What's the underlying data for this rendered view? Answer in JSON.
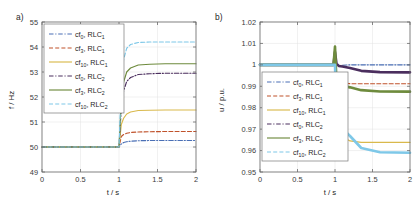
{
  "figure": {
    "panel_a_label": "a)",
    "panel_b_label": "b)"
  },
  "colors": {
    "c0_rlc1": "#4A6FB5",
    "c3_rlc1": "#C0522B",
    "c10_rlc1": "#D9B94C",
    "c0_rlc2": "#4B2E5E",
    "c3_rlc2": "#6E8B3D",
    "c10_rlc2": "#7EC8E8",
    "axis": "#6b6b6b",
    "grid": "#e2e2e2",
    "text": "#262626"
  },
  "legend": {
    "entries": [
      {
        "prefix": "cf",
        "sub": "0",
        "suffix": ", RLC",
        "sub2": "1",
        "label": "cf0, RLC1",
        "color_key": "c0_rlc1",
        "dash": "dashdot"
      },
      {
        "prefix": "cf",
        "sub": "3",
        "suffix": ", RLC",
        "sub2": "1",
        "label": "cf3, RLC1",
        "color_key": "c3_rlc1",
        "dash": "dashed"
      },
      {
        "prefix": "cf",
        "sub": "10",
        "suffix": ", RLC",
        "sub2": "1",
        "label": "cf10, RLC1",
        "color_key": "c10_rlc1",
        "dash": "solid"
      },
      {
        "prefix": "cf",
        "sub": "0",
        "suffix": ", RLC",
        "sub2": "2",
        "label": "cf0, RLC2",
        "color_key": "c0_rlc2",
        "dash": "dashdot"
      },
      {
        "prefix": "cf",
        "sub": "3",
        "suffix": ", RLC",
        "sub2": "2",
        "label": "cf3, RLC2",
        "color_key": "c3_rlc2",
        "dash": "solid"
      },
      {
        "prefix": "cf",
        "sub": "10",
        "suffix": ", RLC",
        "sub2": "2",
        "label": "cf10, RLC2",
        "color_key": "c10_rlc2",
        "dash": "dashed"
      }
    ]
  },
  "chart_data": [
    {
      "id": "panel_a",
      "type": "line",
      "title": "a)",
      "xlabel": "t / s",
      "ylabel": "f / Hz",
      "xlim": [
        0,
        2
      ],
      "ylim": [
        49,
        55
      ],
      "xticks": [
        0,
        0.5,
        1,
        1.5,
        2
      ],
      "xticklabels": [
        "0",
        "0.5",
        "1",
        "1.5",
        "2"
      ],
      "yticks": [
        49,
        50,
        51,
        52,
        53,
        54,
        55
      ],
      "yticklabels": [
        "49",
        "50",
        "51",
        "52",
        "53",
        "54",
        "55"
      ],
      "grid": true,
      "legend_position": "upper-left",
      "event_time": 1.0,
      "series": [
        {
          "name": "cf0, RLC1",
          "color_key": "c0_rlc1",
          "dash": "dashdot",
          "initial": 50.0,
          "final": 50.25,
          "x": [
            0,
            0.5,
            0.95,
            1.0,
            1.03,
            1.06,
            1.1,
            1.15,
            1.25,
            1.4,
            1.6,
            2.0
          ],
          "y": [
            50.0,
            50.0,
            50.0,
            50.0,
            50.12,
            50.18,
            50.21,
            50.23,
            50.25,
            50.26,
            50.26,
            50.26
          ]
        },
        {
          "name": "cf3, RLC1",
          "color_key": "c3_rlc1",
          "dash": "dashed",
          "initial": 50.0,
          "final": 50.62,
          "x": [
            0,
            0.5,
            0.95,
            1.0,
            1.03,
            1.06,
            1.1,
            1.15,
            1.25,
            1.4,
            1.6,
            2.0
          ],
          "y": [
            50.0,
            50.0,
            50.0,
            50.0,
            50.42,
            50.5,
            50.55,
            50.58,
            50.6,
            50.61,
            50.62,
            50.62
          ]
        },
        {
          "name": "cf10, RLC1",
          "color_key": "c10_rlc1",
          "dash": "solid",
          "initial": 50.0,
          "final": 51.48,
          "x": [
            0,
            0.5,
            0.95,
            1.0,
            1.03,
            1.06,
            1.1,
            1.15,
            1.25,
            1.4,
            1.6,
            2.0
          ],
          "y": [
            50.0,
            50.0,
            50.0,
            50.0,
            50.9,
            51.15,
            51.32,
            51.4,
            51.46,
            51.47,
            51.48,
            51.48
          ]
        },
        {
          "name": "cf0, RLC2",
          "color_key": "c0_rlc2",
          "dash": "dashdot",
          "initial": 50.0,
          "final": 52.95,
          "x": [
            0,
            0.5,
            0.95,
            1.0,
            1.03,
            1.06,
            1.1,
            1.15,
            1.25,
            1.4,
            1.6,
            2.0
          ],
          "y": [
            50.0,
            50.0,
            50.0,
            50.0,
            51.6,
            52.25,
            52.62,
            52.78,
            52.9,
            52.93,
            52.95,
            52.95
          ]
        },
        {
          "name": "cf3, RLC2",
          "color_key": "c3_rlc2",
          "dash": "solid",
          "initial": 50.0,
          "final": 53.33,
          "x": [
            0,
            0.5,
            0.95,
            1.0,
            1.03,
            1.06,
            1.1,
            1.15,
            1.25,
            1.4,
            1.6,
            2.0
          ],
          "y": [
            50.0,
            50.0,
            50.0,
            50.0,
            51.9,
            52.6,
            53.0,
            53.16,
            53.28,
            53.31,
            53.33,
            53.33
          ]
        },
        {
          "name": "cf10, RLC2",
          "color_key": "c10_rlc2",
          "dash": "dashed",
          "initial": 50.0,
          "final": 54.2,
          "x": [
            0,
            0.5,
            0.95,
            1.0,
            1.03,
            1.06,
            1.1,
            1.15,
            1.25,
            1.4,
            1.6,
            2.0
          ],
          "y": [
            50.0,
            50.0,
            50.0,
            50.0,
            52.6,
            53.5,
            53.95,
            54.1,
            54.18,
            54.2,
            54.2,
            54.2
          ]
        }
      ]
    },
    {
      "id": "panel_b",
      "type": "line",
      "title": "b)",
      "xlabel": "t / s",
      "ylabel": "u / p.u.",
      "xlim": [
        0,
        2
      ],
      "ylim": [
        0.95,
        1.02
      ],
      "xticks": [
        0,
        0.5,
        1,
        1.5,
        2
      ],
      "xticklabels": [
        "0",
        "0.5",
        "1",
        "1.5",
        "2"
      ],
      "yticks": [
        0.95,
        0.96,
        0.97,
        0.98,
        0.99,
        1.0,
        1.01,
        1.02
      ],
      "yticklabels": [
        "0.95",
        "0.96",
        "0.97",
        "0.98",
        "0.99",
        "1",
        "1.01",
        "1.02"
      ],
      "grid": true,
      "legend_position": "center-left",
      "event_time": 1.0,
      "series": [
        {
          "name": "cf0, RLC1",
          "color_key": "c0_rlc1",
          "dash": "dashdot",
          "initial": 1.0,
          "final": 1.0,
          "x": [
            0,
            0.5,
            0.98,
            1.0,
            1.02,
            1.05,
            1.1,
            1.2,
            1.35,
            1.6,
            2.0
          ],
          "y": [
            1.0,
            1.0,
            1.0,
            1.0,
            1.0,
            0.9995,
            0.9998,
            1.0,
            1.0,
            1.0,
            1.0
          ]
        },
        {
          "name": "cf3, RLC1",
          "color_key": "c3_rlc1",
          "dash": "dashed",
          "initial": 1.0,
          "final": 0.9912,
          "x": [
            0,
            0.5,
            0.98,
            1.0,
            1.02,
            1.05,
            1.1,
            1.2,
            1.35,
            1.6,
            2.0
          ],
          "y": [
            1.0,
            1.0,
            1.0,
            1.0,
            0.9955,
            0.9925,
            0.9915,
            0.9912,
            0.9912,
            0.9912,
            0.9912
          ]
        },
        {
          "name": "cf10, RLC1",
          "color_key": "c10_rlc1",
          "dash": "solid",
          "initial": 1.0,
          "final": 0.9638,
          "x": [
            0,
            0.5,
            0.98,
            1.0,
            1.02,
            1.05,
            1.1,
            1.2,
            1.35,
            1.6,
            2.0
          ],
          "y": [
            1.0,
            1.0,
            1.0,
            1.0,
            0.982,
            0.9705,
            0.9665,
            0.9645,
            0.9638,
            0.9638,
            0.9638
          ]
        },
        {
          "name": "cf0, RLC2",
          "color_key": "c0_rlc2",
          "dash": "dashdot",
          "initial": 1.0,
          "final": 0.9965,
          "x": [
            0,
            0.5,
            0.98,
            1.0,
            1.02,
            1.05,
            1.1,
            1.2,
            1.35,
            1.6,
            2.0
          ],
          "y": [
            1.0,
            1.0,
            1.0,
            1.006,
            1.0005,
            0.9995,
            0.9992,
            0.9985,
            0.9972,
            0.9966,
            0.9965
          ]
        },
        {
          "name": "cf3, RLC2",
          "color_key": "c3_rlc2",
          "dash": "solid",
          "initial": 1.0,
          "final": 0.9875,
          "x": [
            0,
            0.5,
            0.98,
            1.0,
            1.02,
            1.05,
            1.1,
            1.2,
            1.35,
            1.6,
            2.0
          ],
          "y": [
            1.0,
            1.0,
            1.0,
            1.0085,
            0.9918,
            0.9905,
            0.9902,
            0.9895,
            0.9882,
            0.9876,
            0.9875
          ]
        },
        {
          "name": "cf10, RLC2",
          "color_key": "c10_rlc2",
          "dash": "dashed",
          "initial": 1.0,
          "final": 0.959,
          "x": [
            0,
            0.5,
            0.98,
            1.0,
            1.02,
            1.05,
            1.1,
            1.2,
            1.35,
            1.6,
            2.0
          ],
          "y": [
            1.0,
            1.0,
            1.0,
            1.0,
            0.9752,
            0.9718,
            0.9702,
            0.9668,
            0.9612,
            0.9592,
            0.959
          ]
        }
      ]
    }
  ]
}
